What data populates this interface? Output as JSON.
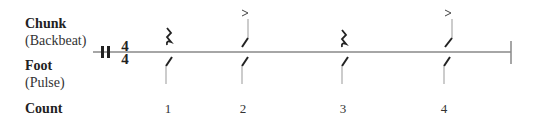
{
  "rows": {
    "chunk": {
      "title": "Chunk",
      "subtitle": "(Backbeat)"
    },
    "foot": {
      "title": "Foot",
      "subtitle": "(Pulse)"
    },
    "count": {
      "title": "Count"
    }
  },
  "time_signature": {
    "top": "4",
    "bottom": "4"
  },
  "beats": [
    {
      "count": "1",
      "chunk": "rest",
      "foot": "slash"
    },
    {
      "count": "2",
      "chunk": "accented-slash",
      "foot": "slash"
    },
    {
      "count": "3",
      "chunk": "rest",
      "foot": "slash"
    },
    {
      "count": "4",
      "chunk": "accented-slash",
      "foot": "slash"
    }
  ],
  "accent_symbol": ">"
}
